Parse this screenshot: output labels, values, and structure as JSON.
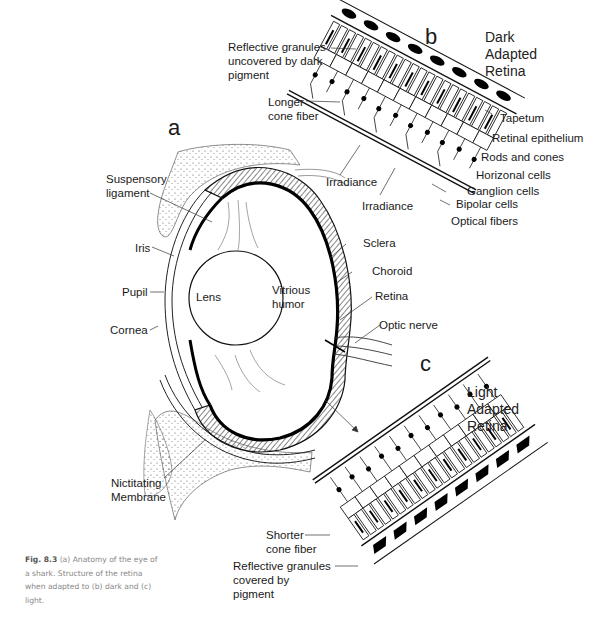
{
  "figure": {
    "panels": {
      "a": "a",
      "b": "b",
      "c": "c"
    },
    "panel_b_title": [
      "Dark",
      "Adapted",
      "Retina"
    ],
    "panel_c_title": [
      "Light",
      "Adapted",
      "Retina"
    ],
    "eye_labels": {
      "suspensory_ligament": [
        "Suspensory",
        "ligament"
      ],
      "iris": "Iris",
      "pupil": "Pupil",
      "cornea": "Cornea",
      "lens": "Lens",
      "vitreous_humor": [
        "Vitrious",
        "humor"
      ],
      "sclera": "Sclera",
      "choroid": "Choroid",
      "retina": "Retina",
      "optic_nerve": "Optic nerve",
      "nictitating_membrane": [
        "Nictitating",
        "Membrane"
      ]
    },
    "dark_retina_labels": {
      "reflective_granules": [
        "Reflective granules",
        "uncovered by dark",
        "pigment"
      ],
      "longer_cone_fiber": [
        "Longer",
        "cone fiber"
      ],
      "tapetum": "Tapetum",
      "retinal_epithelium": "Retinal epithelium",
      "rods_and_cones": "Rods and cones",
      "horizonal_cells": "Horizonal cells",
      "ganglion_cells": "Ganglion cells",
      "bipolar_cells": "Bipolar cells",
      "optical_fibers": "Optical fibers",
      "irradiance_1": "Irradiance",
      "irradiance_2": "Irradiance"
    },
    "light_retina_labels": {
      "shorter_cone_fiber": [
        "Shorter",
        "cone fiber"
      ],
      "reflective_granules": [
        "Reflective granules",
        "covered by",
        "pigment"
      ]
    },
    "caption": {
      "label": "Fig. 8.3",
      "text": "(a) Anatomy of the eye of a shark. Structure of the retina when adapted to (b) dark and (c) light."
    }
  }
}
